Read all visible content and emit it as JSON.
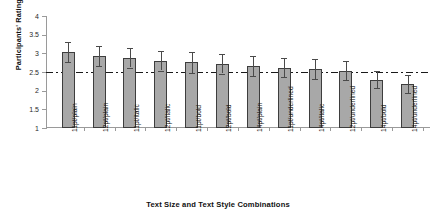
{
  "chart_data": {
    "type": "bar",
    "title": "",
    "xlabel": "Text Size and Text Style Combinations",
    "ylabel": "Participants' Ratings",
    "categories": [
      "11pt/plain",
      "12pt/plain",
      "11pt/italic",
      "12pt/italic",
      "11pt/bold",
      "12pt/bold",
      "14pt/plain",
      "11pt/underlined",
      "14pt/italic",
      "12pt/underlined",
      "14pt/bold",
      "14pt/underlined"
    ],
    "values": [
      3.03,
      2.93,
      2.88,
      2.8,
      2.76,
      2.72,
      2.66,
      2.62,
      2.58,
      2.54,
      2.3,
      2.18
    ],
    "errors": [
      0.27,
      0.26,
      0.26,
      0.26,
      0.28,
      0.26,
      0.26,
      0.26,
      0.26,
      0.26,
      0.24,
      0.24
    ],
    "ylim": [
      1,
      4
    ],
    "yticks": [
      "1",
      "1.5",
      "2",
      "2.5",
      "3",
      "3.5",
      "4"
    ],
    "ytick_values": [
      1,
      1.5,
      2,
      2.5,
      3,
      3.5,
      4
    ],
    "grid": false,
    "legend": "none",
    "reference_line": {
      "value": 2.5,
      "style": "dash-dot",
      "color": "#1a1a1a"
    },
    "bar_color": "#a8a8a8",
    "bar_edge_color": "#3d3d3d",
    "error_bar_color": "#4a4a4a",
    "axis_color": "#9a9a9a"
  }
}
